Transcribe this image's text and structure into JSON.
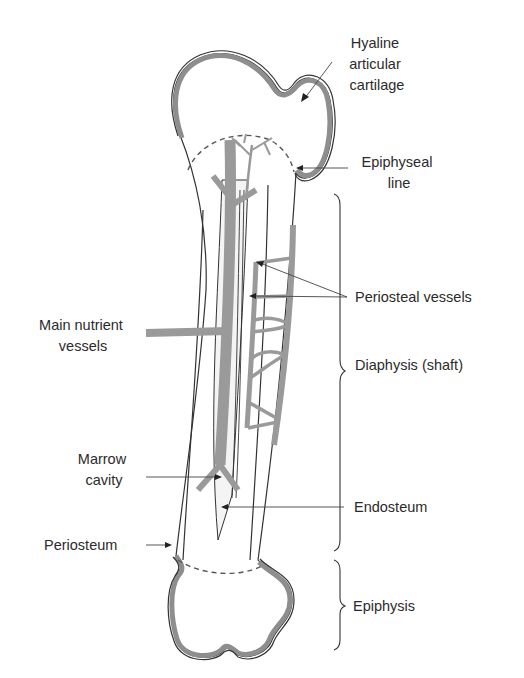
{
  "figure": {
    "labels": {
      "hyaline": [
        "Hyaline",
        "articular",
        "cartilage"
      ],
      "epiphyseal_line": [
        "Epiphyseal",
        "line"
      ],
      "periosteal_vessels": "Periosteal vessels",
      "main_nutrient": [
        "Main nutrient",
        "vessels"
      ],
      "diaphysis": "Diaphysis (shaft)",
      "marrow_cavity": [
        "Marrow",
        "cavity"
      ],
      "endosteum": "Endosteum",
      "periosteum": "Periosteum",
      "epiphysis": "Epiphysis"
    },
    "colors": {
      "bone_fill": "#e6e6e6",
      "cartilage": "#8e8e8e",
      "vessel": "#9a9a9a",
      "outline": "#333333",
      "text": "#2b2b2b"
    }
  }
}
